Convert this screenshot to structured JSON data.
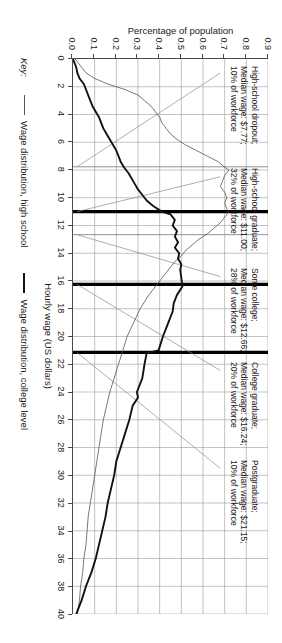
{
  "chart_data": {
    "type": "line",
    "title": "",
    "xlabel": "Hourly wage (US dollars)",
    "ylabel": "Percentage of population",
    "xlim": [
      0,
      40
    ],
    "ylim": [
      0.0,
      0.9
    ],
    "grid": true,
    "xticks": [
      0,
      2,
      4,
      6,
      8,
      10,
      12,
      14,
      16,
      18,
      20,
      22,
      24,
      26,
      28,
      30,
      32,
      34,
      36,
      38,
      40
    ],
    "yticks": [
      "0.0",
      "0.1",
      "0.2",
      "0.3",
      "0.4",
      "0.5",
      "0.6",
      "0.7",
      "0.8",
      "0.9"
    ],
    "legend_position": "below-left",
    "series": [
      {
        "name": "Wage distribution, high school",
        "style": "thin",
        "x": [
          0.0,
          0.6,
          1.0,
          1.4,
          1.8,
          2.2,
          2.6,
          3.0,
          3.4,
          3.8,
          4.2,
          4.6,
          5.0,
          5.4,
          5.8,
          6.2,
          6.6,
          7.0,
          7.4,
          7.8,
          8.0,
          8.4,
          8.8,
          9.2,
          9.6,
          10.0,
          10.4,
          10.8,
          11.0,
          11.4,
          11.8,
          12.2,
          12.6,
          13.0,
          13.4,
          13.8,
          14.2,
          14.6,
          15.0,
          15.6,
          16.2,
          17.0,
          18.0,
          19.0,
          20.0,
          21.0,
          22.0,
          23.0,
          24.0,
          25.0,
          26.0,
          27.0,
          28.0,
          29.0,
          30.0,
          31.0,
          32.0,
          33.0,
          34.0,
          35.0,
          36.0,
          37.0,
          38.0,
          39.0,
          40.0
        ],
        "y": [
          0.01,
          0.04,
          0.06,
          0.1,
          0.16,
          0.24,
          0.3,
          0.33,
          0.36,
          0.38,
          0.4,
          0.41,
          0.43,
          0.45,
          0.48,
          0.52,
          0.57,
          0.62,
          0.67,
          0.7,
          0.72,
          0.7,
          0.69,
          0.68,
          0.7,
          0.71,
          0.7,
          0.71,
          0.72,
          0.7,
          0.68,
          0.65,
          0.62,
          0.58,
          0.55,
          0.52,
          0.5,
          0.47,
          0.45,
          0.42,
          0.39,
          0.35,
          0.31,
          0.28,
          0.25,
          0.23,
          0.21,
          0.19,
          0.17,
          0.155,
          0.14,
          0.13,
          0.12,
          0.11,
          0.1,
          0.09,
          0.08,
          0.07,
          0.065,
          0.06,
          0.05,
          0.045,
          0.035,
          0.03,
          0.02
        ]
      },
      {
        "name": "Wage distribution, college level",
        "style": "thick",
        "x": [
          0.0,
          0.6,
          1.0,
          1.4,
          1.8,
          2.2,
          2.6,
          3.0,
          3.4,
          3.8,
          4.2,
          4.6,
          5.0,
          5.4,
          5.8,
          6.2,
          6.6,
          7.0,
          7.4,
          7.8,
          8.2,
          8.6,
          9.0,
          9.4,
          9.8,
          10.2,
          10.6,
          11.0,
          11.2,
          11.6,
          12.0,
          12.4,
          12.8,
          13.2,
          13.6,
          14.0,
          14.4,
          14.8,
          15.2,
          15.8,
          16.4,
          17.0,
          17.6,
          18.2,
          19.0,
          20.0,
          21.0,
          21.2,
          22.0,
          23.0,
          24.0,
          24.4,
          25.0,
          26.0,
          27.0,
          28.0,
          29.0,
          30.0,
          31.0,
          32.0,
          33.0,
          34.0,
          35.0,
          36.0,
          37.0,
          38.0,
          39.0,
          40.0
        ],
        "y": [
          0.0,
          0.015,
          0.02,
          0.03,
          0.05,
          0.06,
          0.07,
          0.08,
          0.09,
          0.105,
          0.12,
          0.13,
          0.14,
          0.155,
          0.17,
          0.185,
          0.2,
          0.21,
          0.22,
          0.235,
          0.255,
          0.27,
          0.285,
          0.3,
          0.32,
          0.34,
          0.37,
          0.41,
          0.45,
          0.47,
          0.46,
          0.48,
          0.47,
          0.485,
          0.47,
          0.49,
          0.485,
          0.5,
          0.495,
          0.5,
          0.505,
          0.48,
          0.465,
          0.46,
          0.44,
          0.415,
          0.395,
          0.34,
          0.33,
          0.32,
          0.295,
          0.3,
          0.275,
          0.26,
          0.24,
          0.22,
          0.2,
          0.19,
          0.175,
          0.16,
          0.15,
          0.135,
          0.12,
          0.105,
          0.085,
          0.06,
          0.04,
          0.015
        ]
      }
    ],
    "median_markers": [
      {
        "group": "High-school dropout",
        "wage": 7.77,
        "share": "10% of workforce",
        "style": "thin"
      },
      {
        "group": "High-school graduate",
        "wage": 11.0,
        "share": "32% of workforce",
        "style": "thick"
      },
      {
        "group": "Some college",
        "wage": 12.66,
        "share": "28% of workforce",
        "style": "thin"
      },
      {
        "group": "College graduate",
        "wage": 16.24,
        "share": "20% of workforce",
        "style": "thick"
      },
      {
        "group": "Postgraduate",
        "wage": 21.15,
        "share": "10% of workforce",
        "style": "thick"
      }
    ],
    "annotations": [
      {
        "id": "hs-dropout",
        "line1": "High-school dropout;",
        "line2": "Median wage: $7.77;",
        "line3": "10% of workforce"
      },
      {
        "id": "hs-graduate",
        "line1": "High-school graduate;",
        "line2": "Median wage: $11.00;",
        "line3": "32% of workforce"
      },
      {
        "id": "some-college",
        "line1": "Some college;",
        "line2": "Median wage: $12.66;",
        "line3": "28% of workforce"
      },
      {
        "id": "college-graduate",
        "line1": "College graduate;",
        "line2": "Median wage: $16.24;",
        "line3": "20% of workforce"
      },
      {
        "id": "postgraduate",
        "line1": "Postgraduate;",
        "line2": "Median wage: $21.15;",
        "line3": "10% of workforce"
      }
    ]
  },
  "axes": {
    "x_title": "Hourly wage (US dollars)",
    "y_title": "Percentage of population",
    "x_tick_labels": [
      "0",
      "2",
      "4",
      "6",
      "8",
      "10",
      "12",
      "14",
      "16",
      "18",
      "20",
      "22",
      "24",
      "26",
      "28",
      "30",
      "32",
      "34",
      "36",
      "38",
      "40"
    ],
    "y_tick_labels": [
      "0.0",
      "0.1",
      "0.2",
      "0.3",
      "0.4",
      "0.5",
      "0.6",
      "0.7",
      "0.8",
      "0.9"
    ]
  },
  "legend": {
    "key_label": "Key:",
    "entries": [
      {
        "label": "Wage distribution, high school"
      },
      {
        "label": "Wage distribution, college level"
      }
    ]
  },
  "colors": {
    "thin_series": "#555555",
    "thick_series": "#111111",
    "grid": "#9a9a9a",
    "axis": "#4a4a4a",
    "text": "#1a1a1a",
    "background": "#ffffff"
  }
}
